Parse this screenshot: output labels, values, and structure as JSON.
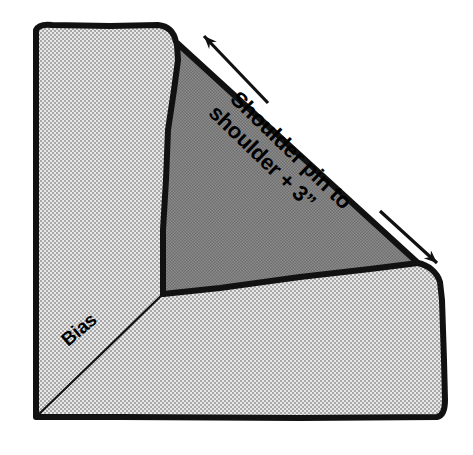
{
  "figure": {
    "background_color": "#ffffff",
    "outline_color": "#111111",
    "fabric_light_color": "#c9c9c9",
    "fabric_dark_color": "#787878",
    "labels": {
      "measurement_line1": "Shoulder pin to",
      "measurement_line2": "shoulder + 3”",
      "bias": "Bias"
    },
    "annotations": {
      "arrow_name": "double-headed-measure-arrow",
      "arrow_start": "200,32",
      "arrow_end": "440,266",
      "bias_line_start": "36,416",
      "bias_line_end": "163,294"
    },
    "regions": {
      "upper_left_panel": "light",
      "center_triangle": "dark",
      "lower_right_panel": "light"
    }
  }
}
